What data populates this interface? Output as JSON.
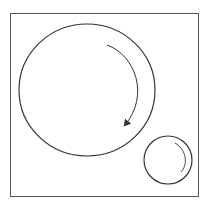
{
  "diagram": {
    "stroke_color": "#333333",
    "frame": {
      "x": 10,
      "y": 13,
      "width": 188,
      "height": 183
    },
    "large_circle": {
      "cx": 87,
      "cy": 90,
      "rx": 68,
      "ry": 66,
      "rotation": "clockwise"
    },
    "small_circle": {
      "cx": 168,
      "cy": 160,
      "r": 24,
      "rotation": "clockwise"
    }
  }
}
